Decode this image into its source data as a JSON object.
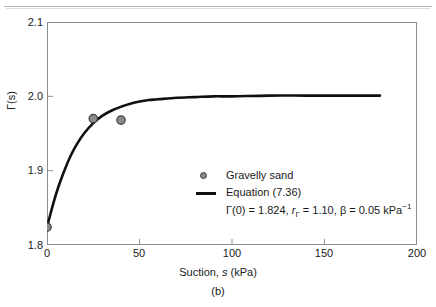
{
  "chart_data": {
    "type": "line",
    "title": "",
    "panel_label": "(b)",
    "xlabel": "Suction, s (kPa)",
    "ylabel": "Γ(s)",
    "xlim": [
      0,
      200
    ],
    "ylim": [
      1.8,
      2.1
    ],
    "xticks": [
      0,
      50,
      100,
      150,
      200
    ],
    "xtick_labels": [
      "0",
      "50",
      "100",
      "150",
      "200"
    ],
    "yticks": [
      1.8,
      1.9,
      2.0,
      2.1
    ],
    "ytick_labels": [
      "1.8",
      "1.9",
      "2.0",
      "2.1"
    ],
    "grid": false,
    "legend_position": "center-right",
    "series": [
      {
        "name": "Gravelly sand",
        "type": "scatter",
        "marker": "circle",
        "color": "#8a8a8a",
        "edge_color": "#3d3d3d",
        "points": [
          {
            "x": 0,
            "y": 1.824
          },
          {
            "x": 25,
            "y": 1.97
          },
          {
            "x": 40,
            "y": 1.968
          }
        ]
      },
      {
        "name": "Equation (7.36)",
        "type": "line",
        "color": "#101010",
        "x": [
          0,
          2,
          4,
          6,
          8,
          10,
          13,
          16,
          20,
          25,
          30,
          35,
          40,
          45,
          50,
          55,
          60,
          70,
          80,
          90,
          100,
          120,
          140,
          160,
          180
        ],
        "y": [
          1.824,
          1.843,
          1.861,
          1.877,
          1.891,
          1.904,
          1.921,
          1.935,
          1.95,
          1.964,
          1.974,
          1.981,
          1.986,
          1.99,
          1.993,
          1.995,
          1.996,
          1.998,
          1.999,
          2.0,
          2.0,
          2.001,
          2.001,
          2.001,
          2.001
        ]
      }
    ],
    "annotations": {
      "gamma_0_label": "Γ(0) =",
      "gamma_0_value": "1.824",
      "r_gamma_label": "r",
      "r_gamma_sub": "Γ",
      "r_gamma_value": "1.10",
      "beta_label": "β =",
      "beta_value": "0.05",
      "beta_unit": "kPa",
      "beta_unit_exp": "−1"
    }
  },
  "axes": {
    "y_title": "Γ(s)",
    "x_title_pre": "Suction, ",
    "x_title_ital": "s",
    "x_title_post": " (kPa)"
  },
  "legend": {
    "entries": [
      {
        "label": "Gravelly sand",
        "kind": "marker"
      },
      {
        "label": "Equation (7.36)",
        "kind": "line"
      }
    ],
    "params_text": "Γ(0) = 1.824, rΓ = 1.10, β = 0.05 kPa−1"
  },
  "caption": {
    "panel": "(b)"
  }
}
